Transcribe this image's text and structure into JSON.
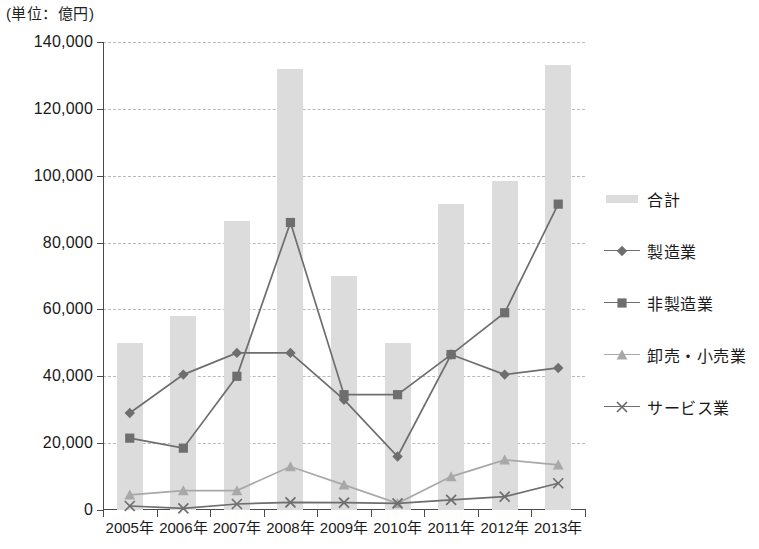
{
  "unit_label": "(単位：億円)",
  "legend": {
    "items": [
      {
        "label": "合計",
        "marker": "bar-swatch",
        "color": "#dcdcdc"
      },
      {
        "label": "製造業",
        "marker": "diamond",
        "color": "#6e6e6e"
      },
      {
        "label": "非製造業",
        "marker": "square",
        "color": "#6e6e6e"
      },
      {
        "label": "卸売・小売業",
        "marker": "triangle",
        "color": "#a8a8a8"
      },
      {
        "label": "サービス業",
        "marker": "cross",
        "color": "#6e6e6e"
      }
    ]
  },
  "chart_data": {
    "type": "bar",
    "title": "",
    "subtitle": "",
    "xlabel": "",
    "ylabel": "",
    "unit": "億円",
    "grid": true,
    "legend_position": "right",
    "categories": [
      "2005年",
      "2006年",
      "2007年",
      "2008年",
      "2009年",
      "2010年",
      "2011年",
      "2012年",
      "2013年"
    ],
    "ylim": [
      0,
      140000
    ],
    "ytick_values": [
      0,
      20000,
      40000,
      60000,
      80000,
      100000,
      120000,
      140000
    ],
    "ytick_labels": [
      "0",
      "20,000",
      "40,000",
      "60,000",
      "80,000",
      "100,000",
      "120,000",
      "140,000"
    ],
    "series": [
      {
        "name": "合計",
        "kind": "bar",
        "color": "#dcdcdc",
        "marker": "bar-swatch",
        "values": [
          50000,
          58000,
          86500,
          132000,
          70000,
          50000,
          91500,
          98500,
          133000
        ]
      },
      {
        "name": "製造業",
        "kind": "line",
        "color": "#6e6e6e",
        "marker": "diamond",
        "values": [
          29000,
          40500,
          47000,
          47000,
          33000,
          16000,
          46500,
          40500,
          42500
        ]
      },
      {
        "name": "非製造業",
        "kind": "line",
        "color": "#6e6e6e",
        "marker": "square",
        "values": [
          21500,
          18500,
          40000,
          86000,
          34500,
          34500,
          46500,
          59000,
          91500
        ]
      },
      {
        "name": "卸売・小売業",
        "kind": "line",
        "color": "#a8a8a8",
        "marker": "triangle",
        "values": [
          4500,
          5800,
          5800,
          13000,
          7500,
          2000,
          10000,
          15000,
          13500
        ]
      },
      {
        "name": "サービス業",
        "kind": "line",
        "color": "#6e6e6e",
        "marker": "cross",
        "values": [
          1200,
          500,
          1800,
          2300,
          2200,
          2000,
          3000,
          4000,
          8000
        ]
      }
    ]
  }
}
